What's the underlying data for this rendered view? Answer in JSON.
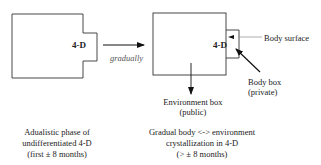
{
  "diagram": {
    "left_panel": {
      "box_label": "4-D",
      "caption": [
        "Adualistic phase of",
        "undifferentiated  4-D",
        "(first ± 8 months)"
      ]
    },
    "transition": {
      "label": "gradually"
    },
    "right_panel": {
      "box_label": "4-D",
      "body_surface_label": "Body surface",
      "body_box_label": [
        "Body box",
        "(private)"
      ],
      "environment_box_label": [
        "Environment box",
        "(public)"
      ],
      "caption": [
        "Gradual body <-> environment",
        "crystallization in 4-D",
        "(> ± 8 months)"
      ]
    }
  }
}
